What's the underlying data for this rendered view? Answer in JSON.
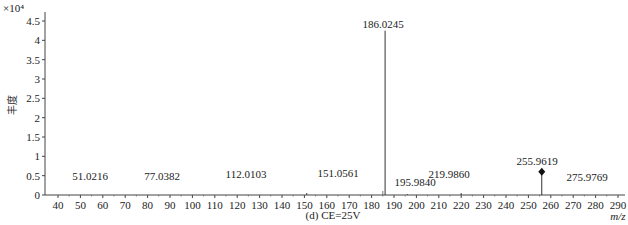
{
  "chart_data": {
    "type": "bar",
    "subtype": "mass-spectrum-stick",
    "title": "",
    "caption": "(d) CE=25V",
    "xlabel": "m/z",
    "ylabel": "丰度",
    "y_multiplier": "×10⁴",
    "xlim": [
      36,
      292
    ],
    "ylim": [
      0,
      4.6
    ],
    "x_ticks": [
      40,
      50,
      60,
      70,
      80,
      90,
      100,
      110,
      120,
      130,
      140,
      150,
      160,
      170,
      180,
      190,
      200,
      210,
      220,
      230,
      240,
      250,
      260,
      270,
      280,
      290
    ],
    "y_ticks": [
      0,
      0.5,
      1,
      1.5,
      2,
      2.5,
      3,
      3.5,
      4,
      4.5
    ],
    "grid": false,
    "peaks": [
      {
        "mz": 51.0216,
        "label": "51.0216",
        "intensity": 0.0
      },
      {
        "mz": 77.0382,
        "label": "77.0382",
        "intensity": 0.0
      },
      {
        "mz": 112.0103,
        "label": "112.0103",
        "intensity": 0.0
      },
      {
        "mz": 151.0561,
        "label": "151.0561",
        "intensity": 0.05
      },
      {
        "mz": 186.0245,
        "label": "186.0245",
        "intensity": 4.25
      },
      {
        "mz": 195.984,
        "label": "195.9840",
        "intensity": 0.02
      },
      {
        "mz": 219.986,
        "label": "219.9860",
        "intensity": 0.05
      },
      {
        "mz": 255.9619,
        "label": "255.9619",
        "intensity": 0.6,
        "marker": "diamond"
      },
      {
        "mz": 275.9769,
        "label": "275.9769",
        "intensity": 0.0
      }
    ]
  }
}
